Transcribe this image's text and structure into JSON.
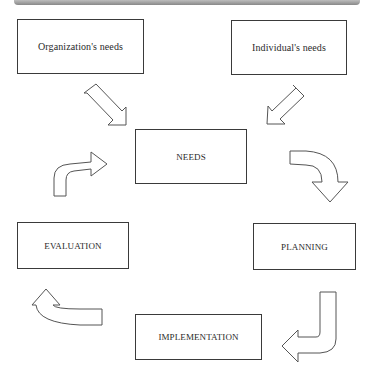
{
  "diagram": {
    "type": "cycle-flow",
    "inputs": [
      {
        "id": "org",
        "label": "Organization's needs"
      },
      {
        "id": "ind",
        "label": "Individual's needs"
      }
    ],
    "cycle": [
      {
        "id": "needs",
        "label": "NEEDS"
      },
      {
        "id": "planning",
        "label": "PLANNING"
      },
      {
        "id": "implementation",
        "label": "IMPLEMENTATION"
      },
      {
        "id": "evaluation",
        "label": "EVALUATION"
      }
    ],
    "edges": [
      [
        "Organization's needs",
        "NEEDS"
      ],
      [
        "Individual's needs",
        "NEEDS"
      ],
      [
        "NEEDS",
        "PLANNING"
      ],
      [
        "PLANNING",
        "IMPLEMENTATION"
      ],
      [
        "IMPLEMENTATION",
        "EVALUATION"
      ],
      [
        "EVALUATION",
        "NEEDS"
      ]
    ],
    "colors": {
      "stroke": "#3a3a3a",
      "fill": "#ffffff",
      "topbar": "#9a9a9a"
    }
  }
}
